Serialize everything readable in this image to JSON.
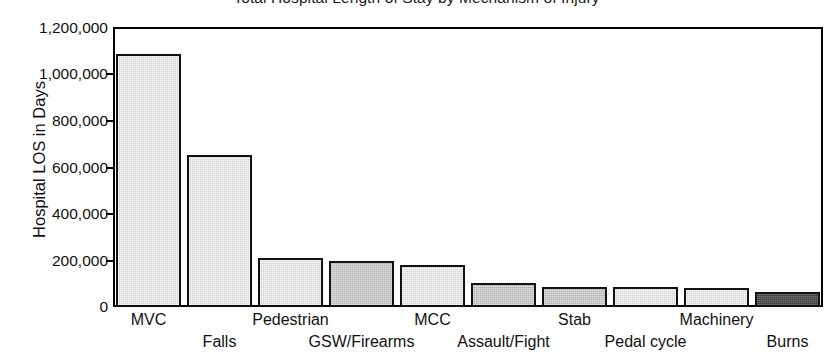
{
  "chart_data": {
    "type": "bar",
    "title": "Total Hospital Length of Stay by Mechanism of Injury",
    "xlabel": "",
    "ylabel": "Hospital LOS in Days",
    "categories": [
      "MVC",
      "Falls",
      "Pedestrian",
      "GSW/Firearms",
      "MCC",
      "Assault/Fight",
      "Stab",
      "Pedal cycle",
      "Machinery",
      "Burns"
    ],
    "values": [
      1085000,
      651000,
      212000,
      198000,
      180000,
      103000,
      87000,
      87000,
      82000,
      64000
    ],
    "ylim": [
      0,
      1200000
    ],
    "ytick_labels": [
      "1,200,000",
      "1,000,000",
      "800,000",
      "600,000",
      "400,000",
      "200,000",
      "0"
    ],
    "ytick_values": [
      1200000,
      1000000,
      800000,
      600000,
      400000,
      200000,
      0
    ],
    "grid": false,
    "legend": false,
    "bar_shades": [
      "shade-a",
      "shade-a",
      "shade-a",
      "shade-b",
      "shade-a",
      "shade-b",
      "shade-b",
      "shade-a",
      "shade-a",
      "shade-dark"
    ],
    "label_rows": [
      0,
      1,
      0,
      1,
      0,
      1,
      0,
      1,
      0,
      1
    ],
    "colors": {
      "light_bar": "#d4d4d4",
      "mid_bar": "#b0b0b0",
      "dark_bar": "#3a3a3a",
      "axis": "#000000",
      "text": "#111111",
      "background": "#ffffff"
    }
  }
}
